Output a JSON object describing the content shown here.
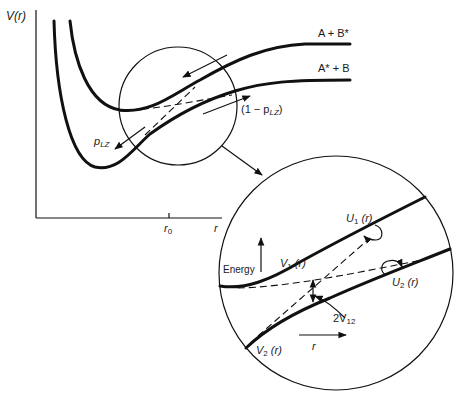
{
  "main_plot": {
    "y_axis_label": "V(r)",
    "x_axis_label": "r",
    "x_tick_label": "r",
    "x_tick_sub": "0",
    "curve_upper_label": "A + B*",
    "curve_lower_label": "A* + B",
    "p_lz_label": "p",
    "p_lz_sub": "LZ",
    "one_minus_p_lz_prefix": "(1 − p",
    "one_minus_p_lz_sub": "LZ",
    "one_minus_p_lz_suffix": ")"
  },
  "inset": {
    "energy_label": "Energy",
    "r_label": "r",
    "v1_label": "V",
    "v1_sub": "1",
    "v1_suffix": " (r)",
    "v2_label": "V",
    "v2_sub": "2",
    "v2_suffix": " (r)",
    "u1_label": "U",
    "u1_sub": "1",
    "u1_suffix": " (r)",
    "u2_label": "U",
    "u2_sub": "2",
    "u2_suffix": " (r)",
    "gap_label": "2V",
    "gap_sub": "12"
  },
  "colors": {
    "ink": "#111111",
    "background": "#ffffff"
  }
}
